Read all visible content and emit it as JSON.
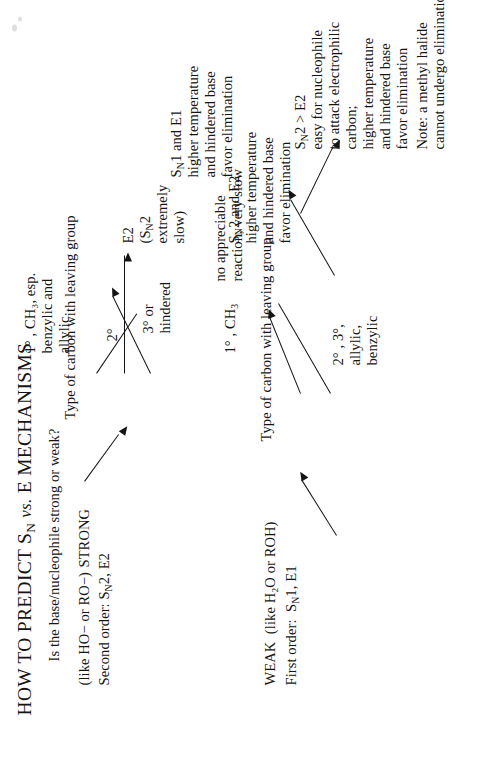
{
  "document": {
    "title": "HOW TO PREDICT Sₙ vs. E MECHANISMS",
    "title_part1": "HOW TO PREDICT S",
    "title_sub1": "N",
    "title_italic": "vs.",
    "title_part2": "E MECHANISMS",
    "question": "Is the base/nucleophile strong or weak?",
    "orientation": "rotated 90 degrees counter-clockwise (text reads bottom-to-top)",
    "ink_color": "#141414",
    "page_color": "#ffffff"
  },
  "branches": {
    "strong": {
      "parenthetical": "(like HO− or RO−)",
      "label": "STRONG",
      "order": "Second order: S",
      "order_sub": "N",
      "order_tail": "2, E2",
      "order_full": "Second order: Sₙ2, E2"
    },
    "weak": {
      "label": "WEAK",
      "parenthetical": "(like H₂O or ROH)",
      "order": "First order:  S",
      "order_sub": "N",
      "order_tail": "1, E1",
      "order_full": "First order: Sₙ1, E1"
    }
  },
  "strong_branch": {
    "prompt": "Type of carbon with leaving group",
    "sub_branches": [
      {
        "condition_lines": [
          "1° , CH₃, esp.",
          "benzylic and",
          "allylic"
        ],
        "outcome_lines": [
          "Sₙ2 > E2",
          "easy for nucleophile",
          "to attack electrophilic",
          "carbon;",
          "higher temperature",
          "and hindered base",
          "favor elimination"
        ],
        "outcome_head": "S",
        "outcome_head_sub": "N",
        "outcome_head_tail": "2 > E2",
        "note": "Note: a methyl halide",
        "note_line2": "cannot undergo elimination."
      },
      {
        "condition_lines": [
          "2°"
        ],
        "outcome_lines": [
          "Sₙ2 and E2",
          "higher temperature",
          "and hindered base",
          "favor elimination"
        ],
        "outcome_head": "S",
        "outcome_head_sub": "N",
        "outcome_head_tail": "2 and E2"
      },
      {
        "condition_lines": [
          "3° or",
          "hindered"
        ],
        "outcome_lines": [
          "E2",
          "(Sₙ2",
          "extremely",
          "slow)"
        ],
        "outcome_head": "E2",
        "outcome_paren_head": "(S",
        "outcome_paren_sub": "N",
        "outcome_paren_tail": "2"
      }
    ]
  },
  "weak_branch": {
    "prompt": "Type of carbon with leaving group",
    "sub_branches": [
      {
        "condition_lines": [
          "1° , CH₃"
        ],
        "condition_head": "1° , CH",
        "condition_sub": "3",
        "outcome_lines": [
          "no appreciable",
          "reaction, very slow"
        ]
      },
      {
        "condition_lines": [
          "2° , 3°,",
          "allylic,",
          "benzylic"
        ],
        "outcome_lines": [
          "Sₙ1 and E1",
          "higher temperature",
          "and hindered base",
          "favor elimination"
        ],
        "outcome_head": "S",
        "outcome_head_sub": "N",
        "outcome_head_tail": "1 and E1"
      }
    ]
  }
}
